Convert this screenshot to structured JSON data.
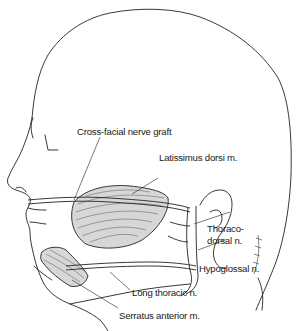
{
  "figure": {
    "labels": {
      "cross_facial": "Cross-facial nerve graft",
      "latissimus": "Latissimus dorsi m.",
      "thoraco_line1": "Thoraco-",
      "thoraco_line2": "dorsal n.",
      "hypoglossal": "Hypoglossal n.",
      "long_thoracic": "Long thoracic n.",
      "serratus": "Serratus anterior m."
    },
    "signature": "R. Ong 1990",
    "colors": {
      "line": "#222222",
      "text": "#1a1a1a",
      "background": "#ffffff"
    }
  }
}
